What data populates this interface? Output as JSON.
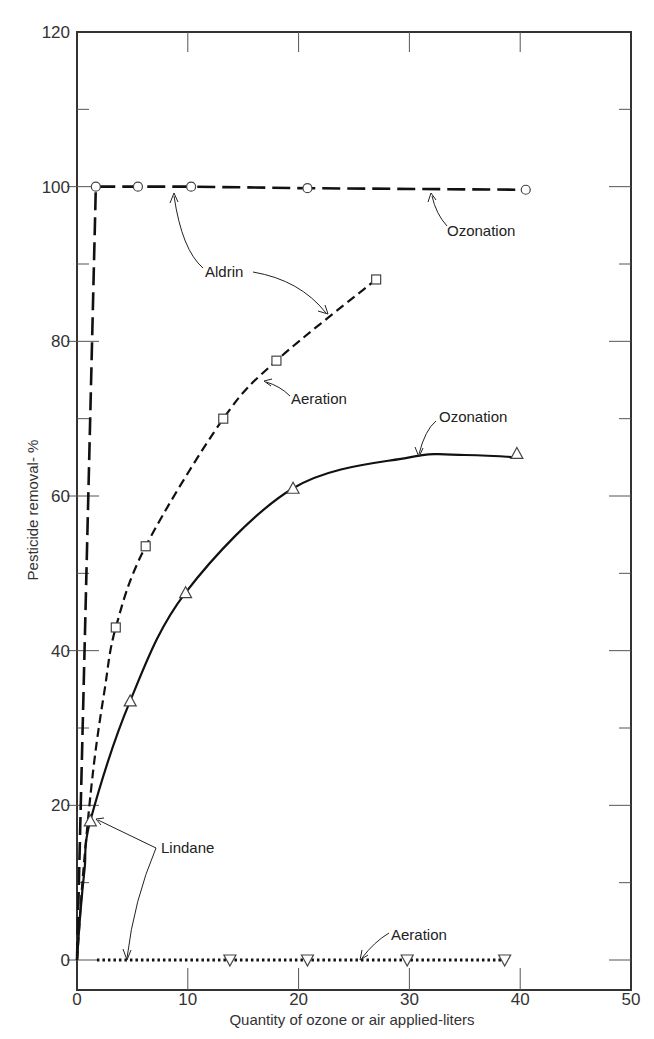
{
  "chart_data": {
    "type": "line",
    "title": "",
    "xlabel": "Quantity of ozone or air applied-liters",
    "ylabel": "Pesticide removal- %",
    "xlim": [
      0,
      50
    ],
    "ylim": [
      -4,
      120
    ],
    "x_ticks": [
      0,
      10,
      20,
      30,
      40,
      50
    ],
    "y_ticks": [
      0,
      20,
      40,
      60,
      80,
      100,
      120
    ],
    "grid": false,
    "legend": "none (inline annotations)",
    "series": [
      {
        "name": "Aldrin - Ozonation",
        "pesticide": "Aldrin",
        "process": "Ozonation",
        "line_style": "long-dash",
        "marker": "circle",
        "x": [
          1.7,
          5.5,
          10.3,
          20.8,
          40.5
        ],
        "y": [
          100,
          100,
          100,
          99.8,
          99.6
        ]
      },
      {
        "name": "Aldrin - Aeration",
        "pesticide": "Aldrin",
        "process": "Aeration",
        "line_style": "short-dash",
        "marker": "square",
        "x": [
          3.5,
          6.2,
          13.2,
          18.0,
          27.0
        ],
        "y": [
          43,
          53.5,
          70,
          77.5,
          88
        ]
      },
      {
        "name": "Lindane - Ozonation",
        "pesticide": "Lindane",
        "process": "Ozonation",
        "line_style": "solid",
        "marker": "triangle-up",
        "x": [
          1.2,
          4.8,
          9.8,
          19.5,
          39.7
        ],
        "y": [
          18,
          33.5,
          47.5,
          61,
          65.5
        ]
      },
      {
        "name": "Lindane - Aeration",
        "pesticide": "Lindane",
        "process": "Aeration",
        "line_style": "dotted",
        "marker": "triangle-down",
        "x": [
          13.8,
          20.8,
          29.8,
          38.6
        ],
        "y": [
          0,
          0,
          0,
          0
        ]
      }
    ],
    "annotations": [
      {
        "text": "Ozonation",
        "target": "Aldrin - Ozonation"
      },
      {
        "text": "Aldrin",
        "target": [
          "Aldrin - Ozonation",
          "Aldrin - Aeration"
        ]
      },
      {
        "text": "Aeration",
        "target": "Aldrin - Aeration"
      },
      {
        "text": "Ozonation",
        "target": "Lindane - Ozonation"
      },
      {
        "text": "Lindane",
        "target": [
          "Lindane - Ozonation",
          "Lindane - Aeration"
        ]
      },
      {
        "text": "Aeration",
        "target": "Lindane - Aeration"
      }
    ]
  },
  "labels": {
    "xlabel": "Quantity of ozone or air applied-liters",
    "ylabel": "Pesticide removal- %",
    "x_ticks": [
      "0",
      "10",
      "20",
      "30",
      "40",
      "50"
    ],
    "y_ticks": [
      "0",
      "20",
      "40",
      "60",
      "80",
      "100",
      "120"
    ],
    "annot_aldrin_ozonation": "Ozonation",
    "annot_aldrin": "Aldrin",
    "annot_aldrin_aeration": "Aeration",
    "annot_lindane_ozonation": "Ozonation",
    "annot_lindane": "Lindane",
    "annot_lindane_aeration": "Aeration"
  }
}
